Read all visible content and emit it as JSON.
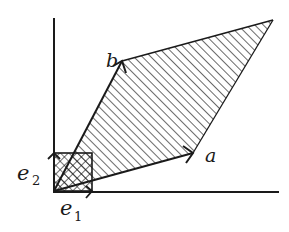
{
  "diagram": {
    "type": "parallelogram spanned by vectors a and b with unit square e1,e2",
    "labels": {
      "a": "a",
      "b": "b",
      "e1_base": "e",
      "e1_sub": "1",
      "e2_base": "e",
      "e2_sub": "2"
    },
    "colors": {
      "stroke": "#1a1a1a",
      "background": "#ffffff"
    }
  }
}
